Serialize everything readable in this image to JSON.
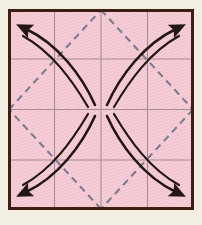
{
  "figure": {
    "canvas": {
      "width": 202,
      "height": 225
    },
    "margin_color": "#f3eee2",
    "colors": {
      "background_fill": "#f6ccd4",
      "background_fill_alt": "#f1bfca",
      "border": "#3d1f12",
      "grid_line": "#97838a",
      "dashed_line": "#7e7a94",
      "arrow": "#221713"
    },
    "frame": {
      "name": "outer-square",
      "x": 8,
      "y": 9,
      "width": 186,
      "height": 201,
      "border_width": 3
    },
    "grid": {
      "name": "background-grid",
      "rows": 4,
      "columns": 4,
      "line_width": 1,
      "vertical_x": [
        54.5,
        101,
        147.5
      ],
      "horizontal_y": [
        59,
        109.5,
        160
      ]
    },
    "dashed_diamond": {
      "name": "inscribed-diamond",
      "line_width": 2,
      "dash_pattern": "7 5",
      "vertices": [
        {
          "label": "top",
          "x": 101,
          "y": 9
        },
        {
          "label": "right",
          "x": 194,
          "y": 109.5
        },
        {
          "label": "bottom",
          "x": 101,
          "y": 210
        },
        {
          "label": "left",
          "x": 8,
          "y": 109.5
        }
      ]
    },
    "arrows": [
      {
        "name": "arrow-top-left",
        "direction": "up-left",
        "quadrant": "top-left",
        "tail": {
          "x": 94,
          "y": 104
        },
        "head": {
          "x": 21,
          "y": 25
        },
        "stroke_width": 2.6
      },
      {
        "name": "arrow-top-right",
        "direction": "up-right",
        "quadrant": "top-right",
        "tail": {
          "x": 108,
          "y": 104
        },
        "head": {
          "x": 181,
          "y": 25
        },
        "stroke_width": 2.6
      },
      {
        "name": "arrow-bottom-right",
        "direction": "down-right",
        "quadrant": "bottom-right",
        "tail": {
          "x": 108,
          "y": 116
        },
        "head": {
          "x": 181,
          "y": 196
        },
        "stroke_width": 2.6
      },
      {
        "name": "arrow-bottom-left",
        "direction": "down-left",
        "quadrant": "bottom-left",
        "tail": {
          "x": 94,
          "y": 116
        },
        "head": {
          "x": 21,
          "y": 196
        },
        "stroke_width": 2.6
      }
    ]
  },
  "chart_data": {
    "type": "diagram",
    "xlabel": "",
    "ylabel": "",
    "grid": true,
    "legend": "none",
    "series": [
      {
        "name": "arrow-top-left",
        "values": [
          "centre",
          "top-left corner"
        ]
      },
      {
        "name": "arrow-top-right",
        "values": [
          "centre",
          "top-right corner"
        ]
      },
      {
        "name": "arrow-bottom-right",
        "values": [
          "centre",
          "bottom-right corner"
        ]
      },
      {
        "name": "arrow-bottom-left",
        "values": [
          "centre",
          "bottom-left corner"
        ]
      }
    ]
  }
}
